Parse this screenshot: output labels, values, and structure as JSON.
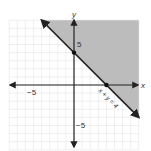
{
  "chart_data": {
    "type": "line",
    "title": "",
    "equation_label": "x + y = 4",
    "inequality": "x + y >= 4",
    "shaded_region": "above line",
    "xlabel": "x",
    "ylabel": "y",
    "x_tick_labels": [
      {
        "value": -5,
        "label": "−5"
      }
    ],
    "y_tick_labels": [
      {
        "value": 5,
        "label": "5"
      },
      {
        "value": -5,
        "label": "−5"
      }
    ],
    "xlim": [
      -8,
      8
    ],
    "ylim": [
      -8,
      8
    ],
    "grid": true,
    "line": {
      "x": [
        -4,
        8
      ],
      "y": [
        8,
        -4
      ],
      "style": "solid"
    },
    "points": [
      {
        "x": 0,
        "y": 4
      },
      {
        "x": 4,
        "y": 0
      }
    ],
    "colors": {
      "shade": "#b5b5b5",
      "line": "#222222",
      "grid": "#e4e4e4",
      "axis": "#222222"
    }
  }
}
